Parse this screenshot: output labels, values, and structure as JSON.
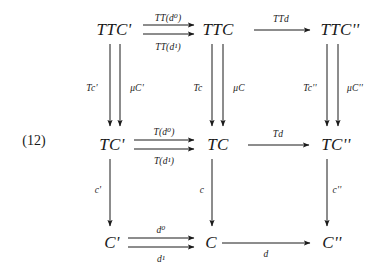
{
  "figure": {
    "equation_number": "(12)",
    "kind": "commutative-diagram",
    "grid": {
      "rows": 3,
      "cols": 3
    }
  },
  "nodes": {
    "r0c0": "TTC'",
    "r0c1": "TTC",
    "r0c2": "TTC''",
    "r1c0": "TC'",
    "r1c1": "TC",
    "r1c2": "TC''",
    "r2c0": "C'",
    "r2c1": "C",
    "r2c2": "C''"
  },
  "horizontal_arrows": {
    "top_left_upper": "TT(d⁰)",
    "top_left_lower": "TT(d¹)",
    "top_right": "TTd",
    "mid_left_upper": "T(d⁰)",
    "mid_left_lower": "T(d¹)",
    "mid_right": "Td",
    "bottom_left_upper": "d⁰",
    "bottom_left_lower": "d¹",
    "bottom_right": "d"
  },
  "vertical_arrows": {
    "col0_upper_left": "Tc'",
    "col0_upper_right": "μC'",
    "col1_upper_left": "Tc",
    "col1_upper_right": "μC",
    "col2_upper_left": "Tc''",
    "col2_upper_right": "μC''",
    "col0_lower": "c'",
    "col1_lower": "c",
    "col2_lower": "c''"
  },
  "style": {
    "ink": "#1a1a1a",
    "background": "#ffffff"
  }
}
